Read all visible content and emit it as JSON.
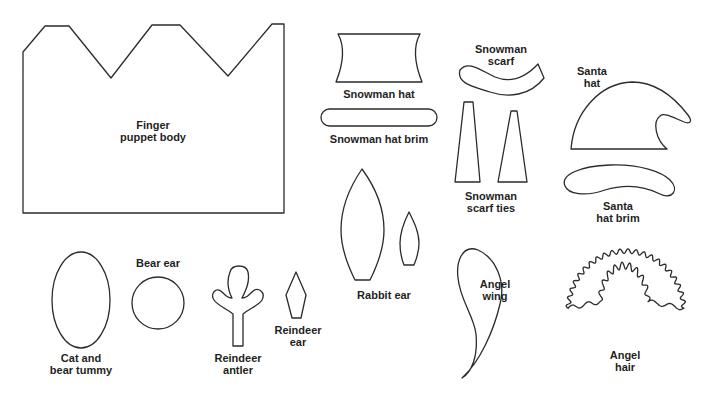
{
  "page": {
    "stroke_color": "#2b2b2b",
    "background": "#ffffff"
  },
  "pieces": [
    {
      "id": "finger-puppet-body",
      "label": "Finger\npuppet body"
    },
    {
      "id": "snowman-hat",
      "label": "Snowman hat"
    },
    {
      "id": "snowman-hat-brim",
      "label": "Snowman hat brim"
    },
    {
      "id": "snowman-scarf",
      "label": "Snowman\nscarf"
    },
    {
      "id": "snowman-scarf-ties",
      "label": "Snowman\nscarf ties"
    },
    {
      "id": "santa-hat",
      "label": "Santa\nhat"
    },
    {
      "id": "santa-hat-brim",
      "label": "Santa\nhat brim"
    },
    {
      "id": "rabbit-ear",
      "label": "Rabbit ear"
    },
    {
      "id": "cat-and-bear-tummy",
      "label": "Cat and\nbear tummy"
    },
    {
      "id": "bear-ear",
      "label": "Bear ear"
    },
    {
      "id": "reindeer-antler",
      "label": "Reindeer\nantler"
    },
    {
      "id": "reindeer-ear",
      "label": "Reindeer\near"
    },
    {
      "id": "angel-wing",
      "label": "Angel\nwing"
    },
    {
      "id": "angel-hair",
      "label": "Angel\nhair"
    }
  ]
}
